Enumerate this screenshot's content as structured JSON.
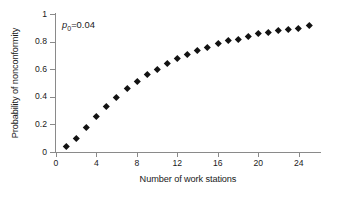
{
  "chart_data": {
    "type": "scatter",
    "title": "",
    "xlabel": "Number of work stations",
    "ylabel": "Probability of nonconformity",
    "xlim": [
      0,
      26.1
    ],
    "ylim": [
      0,
      1
    ],
    "xticks": [
      0,
      4,
      8,
      12,
      16,
      20,
      24
    ],
    "xtick_labels": [
      "0",
      "4",
      "8",
      "12",
      "16",
      "20",
      "24"
    ],
    "yticks": [
      0,
      0.2,
      0.4,
      0.6,
      0.8,
      1
    ],
    "ytick_labels": [
      "0",
      "0.2",
      "0.4",
      "0.6",
      "0.8",
      "1"
    ],
    "grid": false,
    "legend": null,
    "marker": "diamond",
    "marker_color": "#121212",
    "x": [
      1,
      2,
      3,
      4,
      5,
      6,
      7,
      8,
      9,
      10,
      11,
      12,
      13,
      14,
      15,
      16,
      17,
      18,
      19,
      20,
      21,
      22,
      23,
      24,
      25
    ],
    "values": [
      0.04,
      0.1,
      0.18,
      0.26,
      0.33,
      0.4,
      0.46,
      0.51,
      0.56,
      0.6,
      0.64,
      0.68,
      0.71,
      0.74,
      0.76,
      0.79,
      0.81,
      0.82,
      0.84,
      0.86,
      0.87,
      0.88,
      0.89,
      0.9,
      0.92
    ]
  },
  "annotation": {
    "symbol": "p",
    "subscript": "0",
    "equals": "=",
    "value": "0.04",
    "full_text": "p0 = 0.04"
  }
}
